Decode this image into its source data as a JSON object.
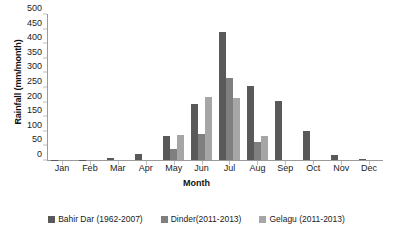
{
  "chart_data": {
    "type": "bar",
    "title": "",
    "xlabel": "Month",
    "ylabel": "Rainfall (mm/month)",
    "ylim": [
      0,
      500
    ],
    "yticks": [
      500,
      450,
      400,
      350,
      300,
      250,
      200,
      150,
      100,
      50,
      0
    ],
    "grid": false,
    "legend_position": "bottom",
    "categories": [
      "Jan",
      "Feb",
      "Mar",
      "Apr",
      "May",
      "Jun",
      "Jul",
      "Aug",
      "Sep",
      "Oct",
      "Nov",
      "Dec"
    ],
    "series": [
      {
        "name": "Bahir Dar (1962-2007)",
        "color": "#595959",
        "values": [
          1,
          1,
          6,
          22,
          82,
          192,
          440,
          252,
          202,
          98,
          17,
          4
        ]
      },
      {
        "name": "Dinder(2011-2013)",
        "color": "#7f7f7f",
        "values": [
          0,
          0,
          0,
          0,
          38,
          88,
          280,
          62,
          0,
          0,
          0,
          0
        ]
      },
      {
        "name": "Gelagu (2011-2013)",
        "color": "#a6a6a6",
        "values": [
          0,
          0,
          0,
          0,
          85,
          216,
          214,
          83,
          0,
          0,
          0,
          0
        ]
      }
    ]
  }
}
